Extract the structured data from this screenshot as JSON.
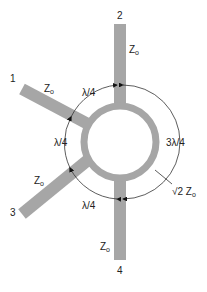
{
  "diagram": {
    "ports": [
      {
        "number": "1",
        "impedance": "Z",
        "subscript": "o"
      },
      {
        "number": "2",
        "impedance": "Z",
        "subscript": "o"
      },
      {
        "number": "3",
        "impedance": "Z",
        "subscript": "o"
      },
      {
        "number": "4",
        "impedance": "Z",
        "subscript": "o"
      }
    ],
    "arc_labels": {
      "p1_p2": "λ/4",
      "p1_p3": "λ/4",
      "p3_p4": "λ/4",
      "p2_p4": "3λ/4"
    },
    "ring_impedance": {
      "prefix": "√2 Z",
      "subscript": "o"
    },
    "colors": {
      "line": "#a6a6a6",
      "text": "#222222",
      "arc": "#333333"
    }
  }
}
